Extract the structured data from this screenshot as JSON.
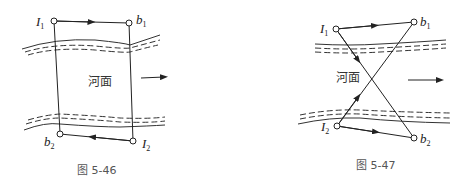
{
  "figures": [
    {
      "caption": "图 5-46",
      "river_label": "河面",
      "points": {
        "I1": {
          "name": "I",
          "sub": "1"
        },
        "b1": {
          "name": "b",
          "sub": "1"
        },
        "b2": {
          "name": "b",
          "sub": "2"
        },
        "I2": {
          "name": "I",
          "sub": "2"
        }
      },
      "flow_direction": "right"
    },
    {
      "caption": "图 5-47",
      "river_label": "河面",
      "points": {
        "I1": {
          "name": "I",
          "sub": "1"
        },
        "b1": {
          "name": "b",
          "sub": "1"
        },
        "I2": {
          "name": "I",
          "sub": "2"
        },
        "b2": {
          "name": "b",
          "sub": "2"
        }
      },
      "flow_direction": "right"
    }
  ],
  "colors": {
    "line": "#222222",
    "text": "#333333",
    "caption": "#555555"
  }
}
